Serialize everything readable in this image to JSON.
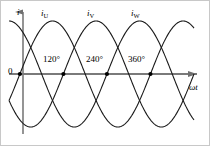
{
  "figure": {
    "axes": {
      "y_label": "i",
      "x_label": "ωt",
      "origin_label": "0"
    },
    "curve_labels": [
      {
        "base": "i",
        "sub": "U"
      },
      {
        "base": "i",
        "sub": "V"
      },
      {
        "base": "i",
        "sub": "W"
      }
    ],
    "angle_labels": [
      "120°",
      "240°",
      "360°"
    ],
    "colors": {
      "curve": "#1a1a1a",
      "axis": "#7a7a7a",
      "text": "#000000",
      "marker": "#000000",
      "background": "#ffffff",
      "border": "#c8c8c8"
    }
  },
  "chart_data": {
    "type": "line",
    "title": "",
    "xlabel": "ωt",
    "ylabel": "i",
    "grid": false,
    "legend": "inline-curve-labels",
    "xlim": [
      -30,
      480
    ],
    "ylim": [
      -1.15,
      1.15
    ],
    "xticks": [
      120,
      240,
      360
    ],
    "xticklabels": [
      "120°",
      "240°",
      "360°"
    ],
    "yticks": [
      0
    ],
    "yticklabels": [
      "0"
    ],
    "amplitude": 1,
    "period_degrees": 360,
    "phase_shift_degrees": 120,
    "markers": {
      "description": "filled dots at zero crossings on the horizontal axis",
      "x_values": [
        0,
        120,
        240,
        360
      ],
      "y_values": [
        0,
        0,
        0,
        0
      ]
    },
    "series": [
      {
        "name": "iU",
        "label": "i_U",
        "phase_deg": 0,
        "expression": "sin(wt)"
      },
      {
        "name": "iV",
        "label": "i_V",
        "phase_deg": -120,
        "expression": "sin(wt - 120)"
      },
      {
        "name": "iW",
        "label": "i_W",
        "phase_deg": -240,
        "expression": "sin(wt - 240)"
      }
    ],
    "x": [
      0,
      15,
      30,
      45,
      60,
      75,
      90,
      105,
      120,
      135,
      150,
      165,
      180,
      195,
      210,
      225,
      240,
      255,
      270,
      285,
      300,
      315,
      330,
      345,
      360,
      375,
      390,
      405,
      420,
      435,
      450
    ],
    "values_iU": [
      0,
      0.26,
      0.5,
      0.71,
      0.87,
      0.97,
      1,
      0.97,
      0.87,
      0.71,
      0.5,
      0.26,
      0,
      -0.26,
      -0.5,
      -0.71,
      -0.87,
      -0.97,
      -1,
      -0.97,
      -0.87,
      -0.71,
      -0.5,
      -0.26,
      0,
      0.26,
      0.5,
      0.71,
      0.87,
      0.97,
      1
    ],
    "values_iV": [
      -0.87,
      -0.97,
      -1,
      -0.97,
      -0.87,
      -0.71,
      -0.5,
      -0.26,
      0,
      0.26,
      0.5,
      0.71,
      0.87,
      0.97,
      1,
      0.97,
      0.87,
      0.71,
      0.5,
      0.26,
      0,
      -0.26,
      -0.5,
      -0.71,
      -0.87,
      -0.97,
      -1,
      -0.97,
      -0.87,
      -0.71,
      -0.5
    ],
    "values_iW": [
      0.87,
      0.71,
      0.5,
      0.26,
      0,
      -0.26,
      -0.5,
      -0.71,
      -0.87,
      -0.97,
      -1,
      -0.97,
      -0.87,
      -0.71,
      -0.5,
      -0.26,
      0,
      0.26,
      0.5,
      0.71,
      0.87,
      0.97,
      1,
      0.97,
      0.87,
      0.71,
      0.5,
      0.26,
      0,
      -0.26,
      -0.5
    ]
  }
}
